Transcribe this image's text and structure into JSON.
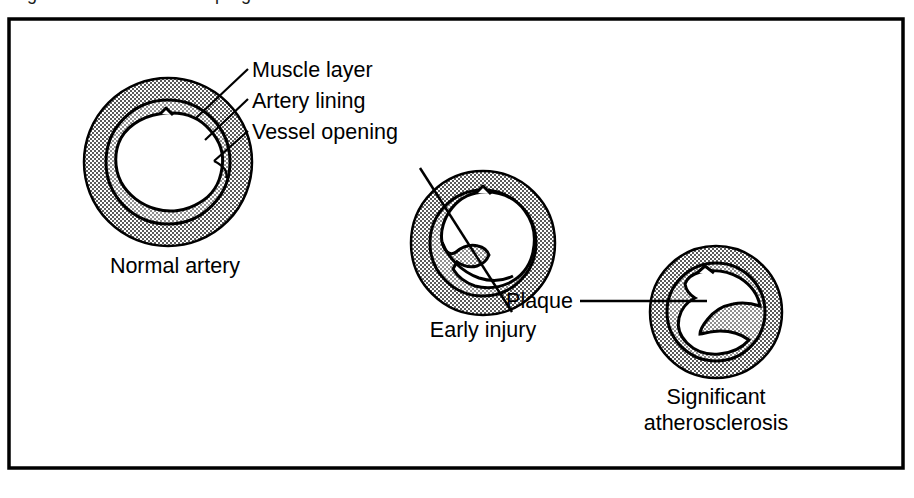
{
  "figure": {
    "title_partial": "Figure 1. Atherosclerosis progression",
    "frame_color": "#000000",
    "background_color": "#ffffff",
    "stipple_color": "#8c8c8c"
  },
  "callout_labels": {
    "muscle_layer": "Muscle layer",
    "artery_lining": "Artery lining",
    "vessel_opening": "Vessel opening",
    "plaque": "Plaque"
  },
  "stages": [
    {
      "id": "normal",
      "caption": "Normal artery",
      "caption_line2": "",
      "description": "Open round lumen with even muscle layer"
    },
    {
      "id": "early-injury",
      "caption": "Early injury",
      "caption_line2": "",
      "description": "Small plaque deposit narrows the vessel opening"
    },
    {
      "id": "significant",
      "caption": "Significant",
      "caption_line2": "atherosclerosis",
      "description": "Large plaque leaves only a narrow slit lumen"
    }
  ]
}
